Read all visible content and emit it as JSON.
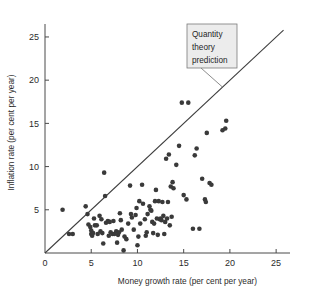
{
  "figure": {
    "width": 312,
    "height": 294,
    "background": "#ffffff"
  },
  "colors": {
    "point": "#3a3a3a",
    "axis": "#4a4a4a",
    "line": "#3d3d3d",
    "callout_fill": "#ececec",
    "callout_border": "#7a7a7a",
    "text": "#2b2b2b"
  },
  "annotation": {
    "line1": "Quantity",
    "line2": "theory",
    "line3": "prediction"
  },
  "chart_data": {
    "type": "scatter",
    "title": "",
    "xlabel": "Money growth rate (per cent per year)",
    "ylabel": "Inflation rate (per cent per year)",
    "xlim": [
      0,
      26.5
    ],
    "ylim": [
      0,
      26.5
    ],
    "xticks": [
      0,
      5,
      10,
      15,
      20,
      25
    ],
    "yticks": [
      0,
      5,
      10,
      15,
      20,
      25
    ],
    "xtick_labels": [
      "0",
      "5",
      "10",
      "15",
      "20",
      "25"
    ],
    "ytick_labels": [
      "0",
      "5",
      "10",
      "15",
      "20",
      "25"
    ],
    "grid": false,
    "legend": null,
    "annotations": [
      {
        "text": "Quantity theory prediction",
        "x": 15.0,
        "y": 24.0,
        "points_to_x": 19.2,
        "points_to_y": 19.2
      }
    ],
    "reference_line": {
      "name": "Quantity theory prediction",
      "type": "identity",
      "slope": 1,
      "intercept": 0,
      "x_start": 0,
      "x_end": 25.8
    },
    "points": [
      [
        1.9,
        5.0
      ],
      [
        2.6,
        2.2
      ],
      [
        3.0,
        2.2
      ],
      [
        4.4,
        5.4
      ],
      [
        4.6,
        4.5
      ],
      [
        4.7,
        3.3
      ],
      [
        4.9,
        3.0
      ],
      [
        5.0,
        2.6
      ],
      [
        5.0,
        2.2
      ],
      [
        5.1,
        2.0
      ],
      [
        5.2,
        2.3
      ],
      [
        5.3,
        4.0
      ],
      [
        5.4,
        3.2
      ],
      [
        5.6,
        3.2
      ],
      [
        5.9,
        4.3
      ],
      [
        6.1,
        3.9
      ],
      [
        6.2,
        2.3
      ],
      [
        6.3,
        1.1
      ],
      [
        6.4,
        9.3
      ],
      [
        6.5,
        6.6
      ],
      [
        6.6,
        3.5
      ],
      [
        6.8,
        3.7
      ],
      [
        6.9,
        2.0
      ],
      [
        7.1,
        2.4
      ],
      [
        7.3,
        2.2
      ],
      [
        7.4,
        3.7
      ],
      [
        7.5,
        2.2
      ],
      [
        7.7,
        2.5
      ],
      [
        7.8,
        1.2
      ],
      [
        7.9,
        2.1
      ],
      [
        8.0,
        2.4
      ],
      [
        8.1,
        4.6
      ],
      [
        8.3,
        2.7
      ],
      [
        8.5,
        0.3
      ],
      [
        8.6,
        1.9
      ],
      [
        8.8,
        1.6
      ],
      [
        9.0,
        3.4
      ],
      [
        9.2,
        7.8
      ],
      [
        9.3,
        4.5
      ],
      [
        9.4,
        4.1
      ],
      [
        9.6,
        2.7
      ],
      [
        9.8,
        4.4
      ],
      [
        10.0,
        0.9
      ],
      [
        10.2,
        6.0
      ],
      [
        10.3,
        3.4
      ],
      [
        10.5,
        7.9
      ],
      [
        10.6,
        5.7
      ],
      [
        10.8,
        3.9
      ],
      [
        10.9,
        2.0
      ],
      [
        11.1,
        4.5
      ],
      [
        11.3,
        5.4
      ],
      [
        11.4,
        5.0
      ],
      [
        11.5,
        4.9
      ],
      [
        11.6,
        3.6
      ],
      [
        11.8,
        3.4
      ],
      [
        11.9,
        6.0
      ],
      [
        12.0,
        7.3
      ],
      [
        12.1,
        4.0
      ],
      [
        12.2,
        2.1
      ],
      [
        12.4,
        3.9
      ],
      [
        12.5,
        4.0
      ],
      [
        12.6,
        3.8
      ],
      [
        12.7,
        5.9
      ],
      [
        12.8,
        4.3
      ],
      [
        12.9,
        2.2
      ],
      [
        13.0,
        3.6
      ],
      [
        13.1,
        10.9
      ],
      [
        13.2,
        4.0
      ],
      [
        13.3,
        5.9
      ],
      [
        13.4,
        11.4
      ],
      [
        13.5,
        3.2
      ],
      [
        13.6,
        7.7
      ],
      [
        13.8,
        8.2
      ],
      [
        13.9,
        7.5
      ],
      [
        14.2,
        10.2
      ],
      [
        14.5,
        12.4
      ],
      [
        14.8,
        17.4
      ],
      [
        15.5,
        17.4
      ],
      [
        15.0,
        6.7
      ],
      [
        15.3,
        6.2
      ],
      [
        16.0,
        2.8
      ],
      [
        16.2,
        11.3
      ],
      [
        16.4,
        12.1
      ],
      [
        16.7,
        2.8
      ],
      [
        17.0,
        8.6
      ],
      [
        17.3,
        6.2
      ],
      [
        17.4,
        5.9
      ],
      [
        17.5,
        13.9
      ],
      [
        17.8,
        8.1
      ],
      [
        18.0,
        7.9
      ],
      [
        19.2,
        14.2
      ],
      [
        19.5,
        14.4
      ],
      [
        19.6,
        15.3
      ],
      [
        6.0,
        2.5
      ],
      [
        9.9,
        5.2
      ],
      [
        11.0,
        2.4
      ],
      [
        12.3,
        6.0
      ],
      [
        10.1,
        1.9
      ],
      [
        8.2,
        3.8
      ],
      [
        5.7,
        2.2
      ],
      [
        7.0,
        3.6
      ],
      [
        13.7,
        4.2
      ],
      [
        11.7,
        2.3
      ]
    ]
  }
}
